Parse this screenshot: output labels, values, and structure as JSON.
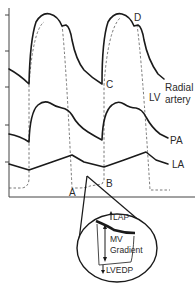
{
  "diagram": {
    "type": "pressure-waveforms",
    "traces": [
      {
        "name": "radial-artery",
        "label_line1": "Radial",
        "label_line2": "artery"
      },
      {
        "name": "lv",
        "label": "LV"
      },
      {
        "name": "pa",
        "label": "PA"
      },
      {
        "name": "la",
        "label": "LA"
      }
    ],
    "points": {
      "A": "A",
      "B": "B",
      "C": "C",
      "D": "D"
    },
    "inset": {
      "lap": "LAP",
      "mv_line1": "MV",
      "mv_line2": "Gradient",
      "lvedp": "LVEDP"
    },
    "colors": {
      "trace": "#1a1a1a",
      "dashed": "#555555",
      "background": "#ffffff"
    }
  }
}
